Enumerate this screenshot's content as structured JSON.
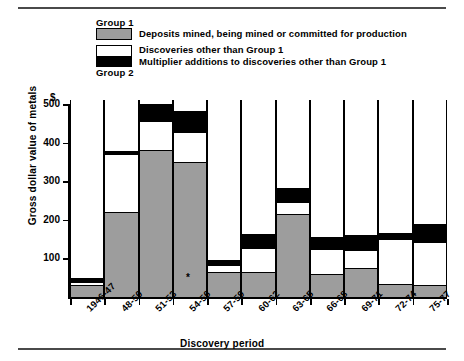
{
  "legend": {
    "group1_label": "Group 1",
    "group2_label": "Group 2",
    "entries": [
      {
        "key": "gray",
        "label": "Deposits mined, being mined or committed for production",
        "color": "#9d9d9d"
      },
      {
        "key": "white",
        "label": "Discoveries other than Group 1",
        "color": "#ffffff"
      },
      {
        "key": "black",
        "label": "Multiplier additions to discoveries other than Group 1",
        "color": "#000000"
      }
    ]
  },
  "axes": {
    "y_unit": "$",
    "y_title": "Gross dollar value of metals",
    "x_title": "Discovery period",
    "y_ticks": [
      100,
      200,
      300,
      400,
      500
    ]
  },
  "chart_data": {
    "type": "bar",
    "title": "",
    "xlabel": "Discovery period",
    "ylabel": "Gross dollar value of metals",
    "ylim": [
      0,
      500
    ],
    "grid": false,
    "stacked": true,
    "legend_position": "top",
    "annotations": [
      "*"
    ],
    "categories": [
      "1946-47",
      "48-50",
      "51-53",
      "54-56",
      "57-59",
      "60-62",
      "63-65",
      "66-68",
      "69-71",
      "72-74",
      "75-77"
    ],
    "series": [
      {
        "name": "Deposits mined, being mined or committed for production",
        "group": "Group 1",
        "color": "#9d9d9d",
        "values": [
          30,
          221,
          382,
          349,
          66,
          66,
          216,
          60,
          76,
          34,
          32
        ]
      },
      {
        "name": "Discoveries other than Group 1",
        "group": "Group 2",
        "color": "#ffffff",
        "values": [
          10,
          150,
          75,
          79,
          17,
          60,
          31,
          64,
          46,
          116,
          110
        ]
      },
      {
        "name": "Multiplier additions to discoveries other than Group 1",
        "group": "Group 2",
        "color": "#000000",
        "values": [
          8,
          8,
          43,
          53,
          14,
          37,
          35,
          31,
          39,
          16,
          48
        ]
      }
    ],
    "totals": [
      48,
      379,
      500,
      481,
      97,
      163,
      282,
      155,
      161,
      166,
      190
    ]
  }
}
